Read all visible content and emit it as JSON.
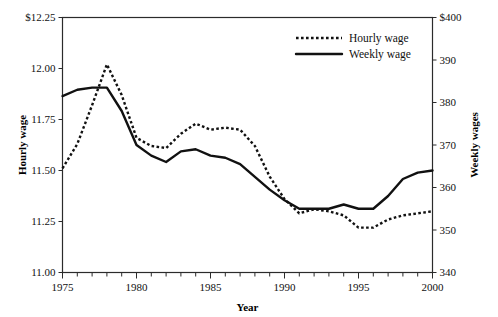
{
  "chart_data": {
    "type": "line",
    "title": "",
    "xlabel": "Year",
    "ylabel": "Hourly wage",
    "y2label": "Weekly wages",
    "grid": false,
    "legend_position": "top-right",
    "xlim": [
      1975,
      2000
    ],
    "ylim": [
      11.0,
      12.25
    ],
    "y2lim": [
      340,
      400
    ],
    "xticks": [
      1975,
      1976,
      1977,
      1978,
      1979,
      1980,
      1981,
      1982,
      1983,
      1984,
      1985,
      1986,
      1987,
      1988,
      1989,
      1990,
      1991,
      1992,
      1993,
      1994,
      1995,
      1996,
      1997,
      1998,
      1999,
      2000
    ],
    "xtick_labels": [
      "1975",
      "",
      "",
      "",
      "",
      "1980",
      "",
      "",
      "",
      "",
      "1985",
      "",
      "",
      "",
      "",
      "1990",
      "",
      "",
      "",
      "",
      "1995",
      "",
      "",
      "",
      "",
      "2000"
    ],
    "yticks": [
      11.0,
      11.25,
      11.5,
      11.75,
      12.0,
      12.25
    ],
    "ytick_labels": [
      "11.00",
      "11.25",
      "11.50",
      "11.75",
      "12.00",
      "$12.25"
    ],
    "y2ticks": [
      340,
      350,
      360,
      370,
      380,
      390,
      400
    ],
    "y2tick_labels": [
      "340",
      "350",
      "360",
      "370",
      "380",
      "390",
      "$400"
    ],
    "x": [
      1975,
      1976,
      1977,
      1978,
      1979,
      1980,
      1981,
      1982,
      1983,
      1984,
      1985,
      1986,
      1987,
      1988,
      1989,
      1990,
      1991,
      1992,
      1993,
      1994,
      1995,
      1996,
      1997,
      1998,
      1999,
      2000
    ],
    "series": [
      {
        "name": "Hourly wage",
        "axis": "left",
        "style": "dotted",
        "values": [
          11.51,
          11.63,
          11.82,
          12.02,
          11.87,
          11.66,
          11.62,
          11.61,
          11.68,
          11.73,
          11.7,
          11.71,
          11.7,
          11.62,
          11.47,
          11.36,
          11.29,
          11.31,
          11.3,
          11.28,
          11.22,
          11.22,
          11.26,
          11.28,
          11.29,
          11.3
        ]
      },
      {
        "name": "Weekly wage",
        "axis": "right",
        "style": "solid",
        "values": [
          381.5,
          383.0,
          383.5,
          383.5,
          378.0,
          370.0,
          367.5,
          366.0,
          368.5,
          369.0,
          367.5,
          367.0,
          365.5,
          362.5,
          359.5,
          357.0,
          355.0,
          355.0,
          355.0,
          356.0,
          355.0,
          355.0,
          358.0,
          362.0,
          363.5,
          364.0
        ]
      }
    ],
    "legend": [
      {
        "label": "Hourly wage",
        "style": "dotted"
      },
      {
        "label": "Weekly wage",
        "style": "solid"
      }
    ]
  }
}
